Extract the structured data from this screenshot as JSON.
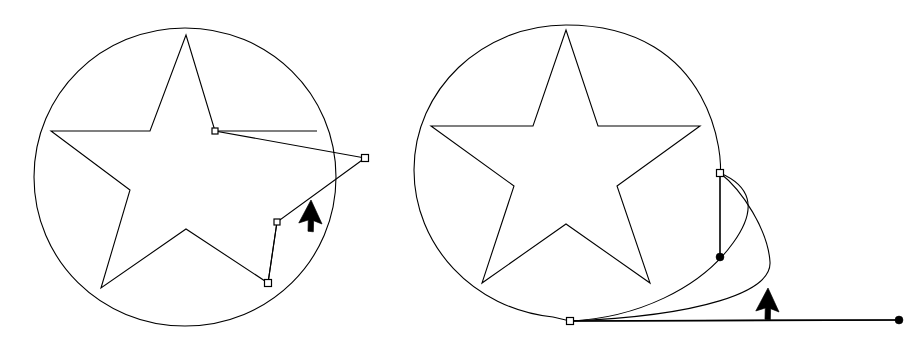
{
  "document": {
    "title": "Vector path editing: star in circle, two states",
    "background_color": "#ffffff",
    "stroke_color": "#000000",
    "anchor_fill_color": "#ffffff",
    "width": 914,
    "height": 342
  },
  "figures": [
    {
      "id": "figure-left",
      "label": "Star with dragged segment",
      "circle": {
        "label": "enclosing-circle",
        "cx": 185,
        "cy": 177,
        "rx": 152,
        "ry": 149,
        "path": "M 185 28 C 101 28 34 94 34 177 C 34 260 101 326 185 326 C 269 326 336 260 336 177 C 336 94 269 28 185 28 Z"
      },
      "star": {
        "label": "five-point-star-distorted",
        "path": "M 186 35 L 215 131 L 365 158 L 277 222 L 268 283 L 186 229 L 101 288 L 130 190 L 51 131 L 150 131 Z"
      },
      "extra_segments": [
        {
          "label": "dragged-edge-upper",
          "path": "M 215 131 L 317 131"
        },
        {
          "label": "dragged-edge-lower",
          "path": "M 268 283 L 277 222"
        }
      ],
      "anchors": [
        {
          "label": "anchor-upper-inner",
          "x": 215,
          "y": 131,
          "size": 6
        },
        {
          "label": "anchor-dragged-tip",
          "x": 365,
          "y": 158,
          "size": 7
        },
        {
          "label": "anchor-lower-inner",
          "x": 277,
          "y": 222,
          "size": 6
        },
        {
          "label": "anchor-bottom-point",
          "x": 268,
          "y": 283,
          "size": 7
        }
      ],
      "handle_dots": [],
      "handle_lines": [],
      "cursor": {
        "label": "mouse-pointer",
        "x": 311,
        "y": 200,
        "rotation": 28
      }
    },
    {
      "id": "figure-right",
      "label": "Star with deformed circle and bezier handles",
      "circle": {
        "label": "enclosing-circle-deformed",
        "cx": 565,
        "cy": 170,
        "rx": 152,
        "ry": 148,
        "path": "M 566 25 C 482 25 414 90 414 170 C 414 245 473 309 553 317 L 570 321 C 636 318 700 289 733 243 C 760 206 748 185 720 173 C 723 165 717 25 566 25 Z"
      },
      "star": {
        "label": "five-point-star",
        "path": "M 566 30 L 598 126 L 700 126 L 617 186 L 650 283 L 566 224 L 482 283 L 514 186 L 431 126 L 533 126 Z"
      },
      "extra_segments": [
        {
          "label": "bulge-curve",
          "path": "M 720 173 C 742 190 768 230 770 262 C 772 292 700 316 570 321"
        },
        {
          "label": "base-line",
          "path": "M 570 321 L 899 320"
        }
      ],
      "anchors": [
        {
          "label": "anchor-right-side",
          "x": 720,
          "y": 173,
          "size": 7
        },
        {
          "label": "anchor-bottom-left",
          "x": 570,
          "y": 321,
          "size": 7
        }
      ],
      "handle_dots": [
        {
          "label": "handle-dot-vertical",
          "x": 720,
          "y": 257,
          "r": 4
        },
        {
          "label": "handle-dot-horizontal",
          "x": 899,
          "y": 320,
          "r": 4
        }
      ],
      "handle_lines": [
        {
          "label": "handle-line-vertical",
          "path": "M 720 176 L 720 257"
        },
        {
          "label": "handle-line-horizontal",
          "path": "M 574 321 L 897 320"
        }
      ],
      "cursor": {
        "label": "mouse-pointer",
        "x": 768,
        "y": 288,
        "rotation": 28
      }
    }
  ],
  "cursor_glyph": {
    "label": "arrow-pointer-filled",
    "path": "M 0 0 L 0 26 L 7 19 L 12 29 L 17 27 L 12 17 L 21 16 Z"
  }
}
